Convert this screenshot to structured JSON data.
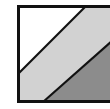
{
  "icon": {
    "name": "diagonal-stripes-swatch",
    "colors": {
      "border": "#111111",
      "white_band": "#ffffff",
      "light_band": "#d2d2d2",
      "dark_band": "#8c8c8c",
      "divider": "#111111"
    }
  }
}
